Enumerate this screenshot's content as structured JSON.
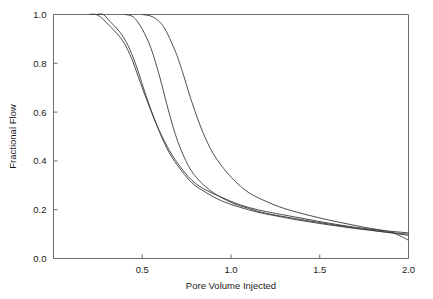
{
  "chart_data": {
    "type": "line",
    "title": "",
    "xlabel": "Pore Volume Injected",
    "ylabel": "Fractional Flow",
    "xlim": [
      0.0,
      2.0
    ],
    "ylim": [
      0.0,
      1.0
    ],
    "xticks": [
      0.5,
      1.0,
      1.5,
      2.0
    ],
    "xtick_labels": [
      "0.5",
      "1.0",
      "1.5",
      "2.0"
    ],
    "yticks": [
      0.0,
      0.2,
      0.4,
      0.6,
      0.8,
      1.0
    ],
    "ytick_labels": [
      "0.0",
      "0.2",
      "0.4",
      "0.6",
      "0.8",
      "1.0"
    ],
    "grid": false,
    "legend": false,
    "legend_position": "none",
    "series": [
      {
        "name": "curve-1",
        "color": "#3a3a3a",
        "x": [
          0.2,
          0.24,
          0.28,
          0.32,
          0.36,
          0.4,
          0.44,
          0.48,
          0.52,
          0.58,
          0.64,
          0.7,
          0.78,
          0.86,
          0.95,
          1.05,
          1.15,
          1.25,
          1.4,
          1.55,
          1.7,
          1.85,
          2.0
        ],
        "y": [
          1.0,
          1.0,
          0.98,
          0.95,
          0.92,
          0.88,
          0.82,
          0.74,
          0.66,
          0.55,
          0.46,
          0.39,
          0.32,
          0.28,
          0.25,
          0.22,
          0.2,
          0.185,
          0.165,
          0.145,
          0.128,
          0.115,
          0.105
        ]
      },
      {
        "name": "curve-2",
        "color": "#3a3a3a",
        "x": [
          0.24,
          0.28,
          0.32,
          0.36,
          0.4,
          0.44,
          0.48,
          0.52,
          0.58,
          0.64,
          0.7,
          0.78,
          0.86,
          0.95,
          1.05,
          1.15,
          1.25,
          1.4,
          1.55,
          1.7,
          1.85,
          2.0
        ],
        "y": [
          1.0,
          1.0,
          0.97,
          0.94,
          0.9,
          0.84,
          0.76,
          0.67,
          0.55,
          0.45,
          0.38,
          0.31,
          0.27,
          0.235,
          0.21,
          0.19,
          0.175,
          0.155,
          0.138,
          0.123,
          0.11,
          0.1
        ]
      },
      {
        "name": "curve-3",
        "color": "#3a3a3a",
        "x": [
          0.4,
          0.45,
          0.5,
          0.55,
          0.6,
          0.65,
          0.7,
          0.76,
          0.82,
          0.9,
          1.0,
          1.1,
          1.2,
          1.35,
          1.5,
          1.65,
          1.8,
          2.0
        ],
        "y": [
          1.0,
          0.99,
          0.94,
          0.86,
          0.74,
          0.6,
          0.48,
          0.38,
          0.32,
          0.27,
          0.23,
          0.205,
          0.185,
          0.165,
          0.147,
          0.13,
          0.115,
          0.095
        ]
      },
      {
        "name": "curve-4",
        "color": "#3a3a3a",
        "x": [
          0.5,
          0.56,
          0.62,
          0.68,
          0.72,
          0.78,
          0.84,
          0.9,
          0.98,
          1.08,
          1.18,
          1.3,
          1.45,
          1.6,
          1.75,
          1.9,
          2.0
        ],
        "y": [
          1.0,
          0.99,
          0.95,
          0.86,
          0.78,
          0.64,
          0.52,
          0.43,
          0.35,
          0.28,
          0.24,
          0.205,
          0.175,
          0.15,
          0.128,
          0.108,
          0.075
        ]
      }
    ]
  }
}
